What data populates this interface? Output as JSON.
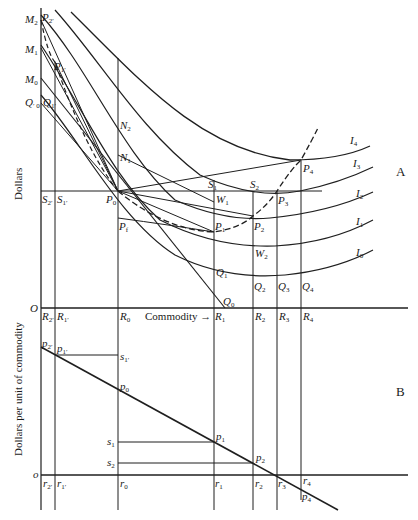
{
  "figure": {
    "panels": {
      "A": {
        "label": "A",
        "y_axis_label": "Dollars",
        "x_axis_label": "Commodity →",
        "origin_label": "O"
      },
      "B": {
        "label": "B",
        "y_axis_label": "Dollars per unit of commodity",
        "origin_label": "o"
      }
    },
    "curves": {
      "indifference": [
        "I₄",
        "I₃",
        "I₂",
        "I₁",
        "I₀"
      ]
    },
    "labels_A_left": [
      "M₂",
      "M₁",
      "M₀",
      "Q₀′",
      "P₂′",
      "P₁′",
      "Q₁′"
    ],
    "labels_A_mid": [
      "N₂",
      "N₁",
      "S₂′",
      "S₁′",
      "P₀",
      "Pƒ",
      "S₁",
      "S₂",
      "W₁",
      "W₂",
      "P₁",
      "P₂",
      "P₃",
      "P₄"
    ],
    "labels_A_bottom": [
      "Q₁",
      "Q₂",
      "Q₃",
      "Q₄",
      "Q₀"
    ],
    "labels_R_axis": [
      "R₂′",
      "R₁′",
      "R₀",
      "R₁",
      "R₂",
      "R₃",
      "R₄"
    ],
    "labels_B": [
      "p₂′",
      "p₁′",
      "s₁′",
      "p₀",
      "s₁",
      "s₂",
      "p₁",
      "p₂",
      "p₄"
    ],
    "labels_r_axis": [
      "r₂′",
      "r₁′",
      "r₀",
      "r₁",
      "r₂",
      "r₃",
      "r₄"
    ]
  },
  "text": {
    "M2": "M",
    "M2s": "2",
    "M1": "M",
    "M1s": "1",
    "M0": "M",
    "M0s": "0",
    "Q0p": "Q",
    "Q0ps": "′ 0",
    "P2p": "P",
    "P2ps": "2′",
    "P1p": "P",
    "P1ps": "1′",
    "Q1p": "Q",
    "Q1ps": "1′",
    "N2": "N",
    "N2s": "2",
    "N1": "N",
    "N1s": "1",
    "S2p": "S",
    "S2ps": "2′",
    "S1p": "S",
    "S1ps": "1′",
    "P0": "P",
    "P0s": "0",
    "Pf": "P",
    "Pfs": "f",
    "S1": "S",
    "S1s": "1",
    "S2": "S",
    "S2s": "2",
    "W1": "W",
    "W1s": "1",
    "W2": "W",
    "W2s": "2",
    "P1": "P",
    "P1s": "1",
    "P2": "P",
    "P2s": "2",
    "P3": "P",
    "P3s": "3",
    "P4": "P",
    "P4s": "4",
    "Q1": "Q",
    "Q1s": "1",
    "Q2": "Q",
    "Q2s": "2",
    "Q3": "Q",
    "Q3s": "3",
    "Q4": "Q",
    "Q4s": "4",
    "Q0": "Q",
    "Q0s": "0",
    "I4": "I",
    "I4s": "4",
    "I3": "I",
    "I3s": "3",
    "I2": "I",
    "I2s": "2",
    "I1": "I",
    "I1s": "1",
    "I0": "I",
    "I0s": "0",
    "O": "O",
    "R2p": "R",
    "R2ps": "2′",
    "R1p": "R",
    "R1ps": "1′",
    "R0": "R",
    "R0s": "0",
    "commodity": "Commodity →",
    "R1": "R",
    "R1s": "1",
    "R2": "R",
    "R2s": "2",
    "R3": "R",
    "R3s": "3",
    "R4": "R",
    "R4s": "4",
    "dollars": "Dollars",
    "panelA": "A",
    "panelB": "B",
    "dpu": "Dollars per unit of commodity",
    "p2p": "p",
    "p2ps": "2′",
    "p1p": "p",
    "p1ps": "1′",
    "s1p": "s",
    "s1ps": "1′",
    "p0": "p",
    "p0s": "0",
    "s1": "s",
    "s1s": "1",
    "s2": "s",
    "s2s": "2",
    "p1": "p",
    "p1s": "1",
    "p2": "p",
    "p2s": "2",
    "p4": "p",
    "p4s": "4",
    "o": "o",
    "r2p": "r",
    "r2ps": "2′",
    "r1p": "r",
    "r1ps": "1′",
    "r0": "r",
    "r0s": "0",
    "r1": "r",
    "r1s": "1",
    "r2": "r",
    "r2s": "2",
    "r3": "r",
    "r3s": "3",
    "r4": "r",
    "r4s": "4"
  }
}
